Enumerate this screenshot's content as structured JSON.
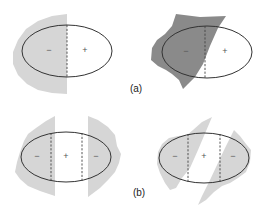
{
  "figure": {
    "colors": {
      "light_region": "#d6d6d6",
      "dark_region": "#8a8a8a",
      "outline": "#333333",
      "background": "#ffffff"
    },
    "parts": [
      {
        "label": "(a)",
        "panels": [
          {
            "id": "a-left",
            "region_shade": "light",
            "signs": [
              "−",
              "+"
            ]
          },
          {
            "id": "a-right",
            "region_shade": "dark",
            "signs": [
              "−",
              "+"
            ]
          }
        ]
      },
      {
        "label": "(b)",
        "panels": [
          {
            "id": "b-left",
            "region_shade": "light",
            "signs": [
              "−",
              "+",
              "−"
            ]
          },
          {
            "id": "b-right",
            "region_shade": "light",
            "signs": [
              "−",
              "+",
              "−"
            ]
          }
        ]
      }
    ]
  }
}
